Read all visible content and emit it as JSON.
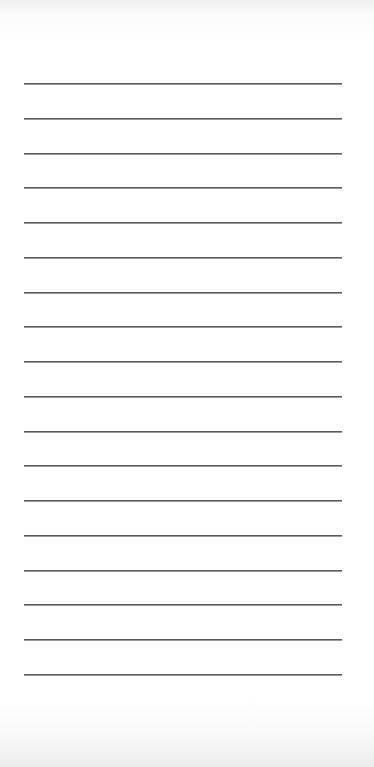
{
  "page": {
    "type": "lined-paper",
    "background_color": "#ffffff",
    "line_color": "#5a5a5a",
    "line_count": 18,
    "line_left": 24,
    "line_width": 318,
    "first_line_y": 83,
    "line_spacing": 34.75
  }
}
